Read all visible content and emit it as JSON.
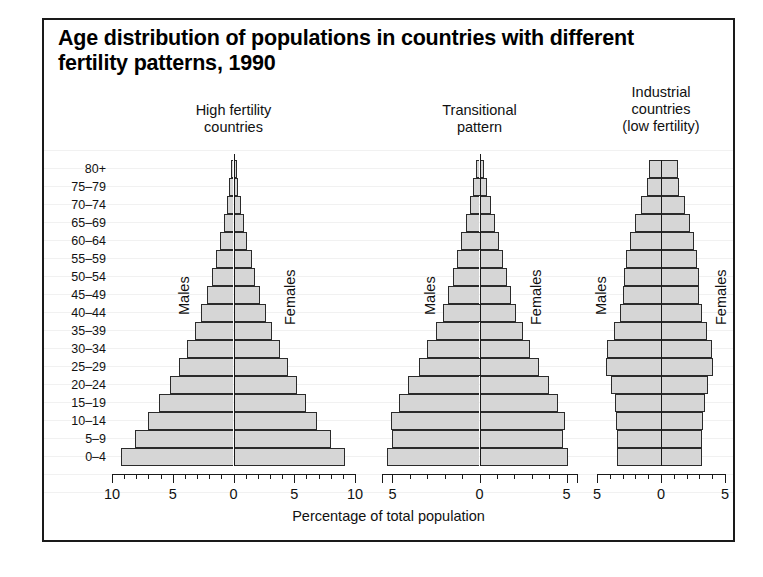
{
  "title": "Age distribution of populations in countries with different fertility patterns, 1990",
  "axis_label": "Percentage of total population",
  "series_labels": {
    "male": "Males",
    "female": "Females"
  },
  "panels": [
    {
      "title_lines": [
        "High fertility",
        "countries"
      ],
      "ticks": [
        "10",
        "5",
        "0",
        "5",
        "10"
      ]
    },
    {
      "title_lines": [
        "Transitional",
        "pattern"
      ],
      "ticks": [
        "5",
        "0",
        "5"
      ]
    },
    {
      "title_lines": [
        "Industrial",
        "countries",
        "(low fertility)"
      ],
      "ticks": [
        "5",
        "0",
        "5"
      ]
    }
  ],
  "chart_data": {
    "type": "bar",
    "subtype": "population-pyramid",
    "title": "Age distribution of populations in countries with different fertility patterns, 1990",
    "xlabel": "Percentage of total population",
    "ylabel": "Age group",
    "grid": false,
    "legend": [
      "Males",
      "Females"
    ],
    "legend_position": "inside-panel",
    "categories": [
      "0–4",
      "5–9",
      "10–14",
      "15–19",
      "20–24",
      "25–29",
      "30–34",
      "35–39",
      "40–44",
      "45–49",
      "50–54",
      "55–59",
      "60–64",
      "65–69",
      "70–74",
      "75–79",
      "80+"
    ],
    "panels": [
      {
        "name": "High fertility countries",
        "xlim": [
          -10,
          10
        ],
        "xticks": [
          -10,
          -5,
          0,
          5,
          10
        ],
        "series": [
          {
            "name": "Males",
            "values": [
              9.3,
              8.1,
              7.0,
              6.1,
              5.2,
              4.5,
              3.8,
              3.2,
              2.7,
              2.2,
              1.8,
              1.4,
              1.1,
              0.8,
              0.55,
              0.33,
              0.2
            ]
          },
          {
            "name": "Females",
            "values": [
              9.2,
              8.0,
              6.9,
              6.0,
              5.2,
              4.5,
              3.8,
              3.2,
              2.7,
              2.2,
              1.8,
              1.5,
              1.1,
              0.85,
              0.6,
              0.38,
              0.25
            ]
          }
        ]
      },
      {
        "name": "Transitional pattern",
        "xlim": [
          -5.6,
          5.6
        ],
        "xticks": [
          -5,
          0,
          5
        ],
        "series": [
          {
            "name": "Males",
            "values": [
              5.3,
              5.0,
              5.1,
              4.6,
              4.1,
              3.5,
              3.0,
              2.5,
              2.1,
              1.8,
              1.55,
              1.3,
              1.05,
              0.8,
              0.55,
              0.35,
              0.2
            ]
          },
          {
            "name": "Females",
            "values": [
              5.1,
              4.8,
              4.9,
              4.5,
              4.0,
              3.4,
              2.9,
              2.5,
              2.1,
              1.8,
              1.6,
              1.35,
              1.1,
              0.9,
              0.65,
              0.42,
              0.28
            ]
          }
        ]
      },
      {
        "name": "Industrial countries (low fertility)",
        "xlim": [
          -5,
          5
        ],
        "xticks": [
          -5,
          0,
          5
        ],
        "series": [
          {
            "name": "Males",
            "values": [
              3.4,
              3.4,
              3.5,
              3.6,
              3.9,
              4.3,
              4.2,
              3.7,
              3.2,
              3.0,
              2.9,
              2.7,
              2.4,
              2.0,
              1.6,
              1.1,
              0.9
            ]
          },
          {
            "name": "Females",
            "values": [
              3.2,
              3.2,
              3.3,
              3.4,
              3.7,
              4.1,
              4.0,
              3.6,
              3.2,
              3.0,
              3.0,
              2.8,
              2.6,
              2.3,
              1.9,
              1.4,
              1.3
            ]
          }
        ]
      }
    ]
  },
  "colors": {
    "bar_fill": "#d6d6d6",
    "bar_stroke": "#2b2b2b",
    "frame": "#1a1a1a",
    "text": "#111111"
  }
}
